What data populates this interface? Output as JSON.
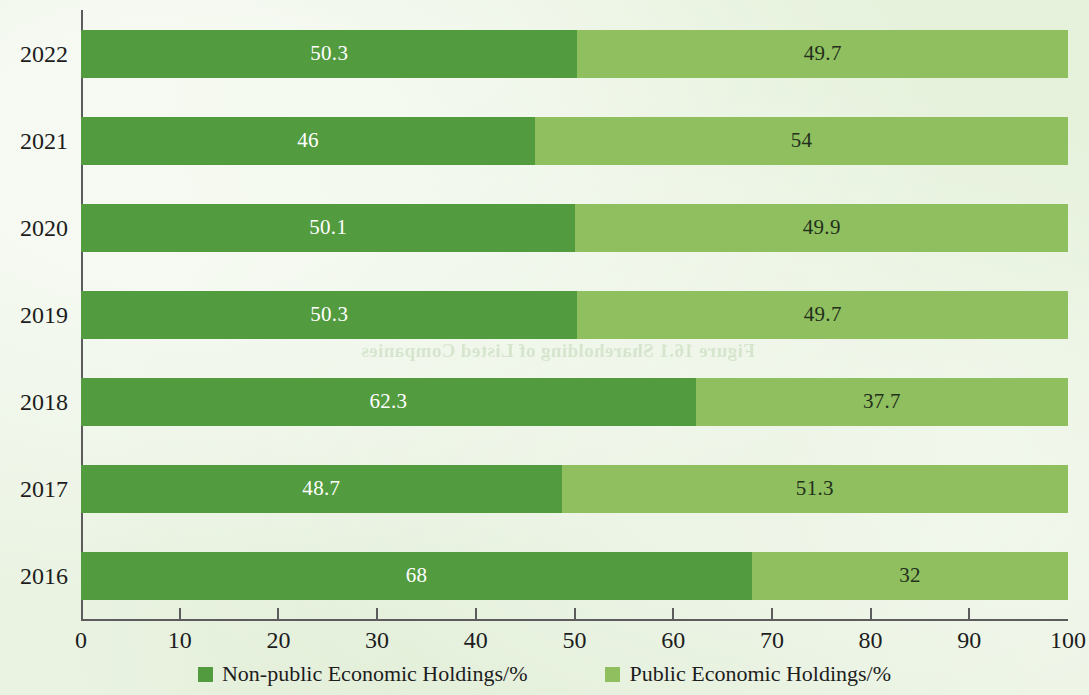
{
  "page": {
    "background_color": "#eaf3e2",
    "bleed_through_text": "Figure 16.1 Shareholding of Listed Companies"
  },
  "chart_data": {
    "type": "bar",
    "orientation": "horizontal",
    "stacked": true,
    "normalized_total": 100,
    "title": "",
    "subtitle": "",
    "xlabel": "",
    "ylabel": "",
    "xlim": [
      0,
      100
    ],
    "xticks": [
      "0",
      "10",
      "20",
      "30",
      "40",
      "50",
      "60",
      "70",
      "80",
      "90",
      "100"
    ],
    "grid": false,
    "legend_position": "bottom",
    "categories": [
      "2022",
      "2021",
      "2020",
      "2019",
      "2018",
      "2017",
      "2016"
    ],
    "series": [
      {
        "name": "Non-public Economic Holdings/%",
        "color": "#539b3f",
        "label_color": "#ffffff",
        "values": [
          50.3,
          46,
          50.1,
          50.3,
          62.3,
          48.7,
          68
        ],
        "value_labels": [
          "50.3",
          "46",
          "50.1",
          "50.3",
          "62.3",
          "48.7",
          "68"
        ]
      },
      {
        "name": "Public Economic Holdings/%",
        "color": "#8fbf5f",
        "label_color": "#23301c",
        "values": [
          49.7,
          54,
          49.9,
          49.7,
          37.7,
          51.3,
          32
        ],
        "value_labels": [
          "49.7",
          "54",
          "49.9",
          "49.7",
          "37.7",
          "51.3",
          "32"
        ]
      }
    ],
    "legend": [
      {
        "label": "Non-public Economic Holdings/%",
        "color": "#539b3f"
      },
      {
        "label": "Public Economic Holdings/%",
        "color": "#8fbf5f"
      }
    ]
  }
}
